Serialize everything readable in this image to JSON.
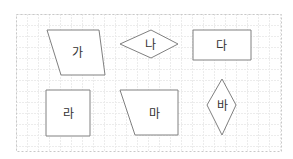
{
  "figure": {
    "width": 293,
    "height": 159,
    "border": {
      "x": 16,
      "y": 14,
      "width": 265,
      "height": 137,
      "color": "#c8c8c8",
      "style": "dashed"
    },
    "grid": {
      "spacing": 11,
      "color": "#ececec"
    },
    "stroke_color": "#808080",
    "text_color": "#333333"
  },
  "shapes": [
    {
      "id": "ga",
      "label": "가",
      "type": "parallelogram",
      "points": "47,30 99,30 105,75 61,75",
      "label_x": 77,
      "label_y": 53
    },
    {
      "id": "na",
      "label": "나",
      "type": "rhombus",
      "points": "120,44 151,30 178,44 151,58",
      "label_x": 150,
      "label_y": 45
    },
    {
      "id": "da",
      "label": "다",
      "type": "rectangle",
      "points": "193,30 251,30 251,60 193,60",
      "label_x": 221,
      "label_y": 46
    },
    {
      "id": "ra",
      "label": "라",
      "type": "square",
      "points": "46,90 90,90 90,136 46,136",
      "label_x": 68,
      "label_y": 114
    },
    {
      "id": "ma",
      "label": "마",
      "type": "trapezoid",
      "points": "120,90 178,90 178,135 135,135",
      "label_x": 154,
      "label_y": 114
    },
    {
      "id": "ba",
      "label": "바",
      "type": "rhombus",
      "points": "222,79 236,105 222,135 207,105",
      "label_x": 222,
      "label_y": 106
    }
  ]
}
